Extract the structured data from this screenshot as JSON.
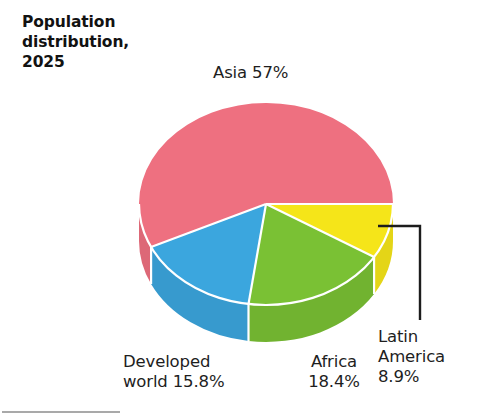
{
  "figure": {
    "title": "Population\ndistribution,\n2025",
    "background_color": "#ffffff"
  },
  "chart_data": {
    "type": "pie",
    "title": "Population distribution, 2025",
    "xlabel": "",
    "ylabel": "",
    "legend_position": "none",
    "grid": false,
    "style": "3d-exploded-none",
    "unit": "%",
    "categories": [
      "Asia",
      "Developed world",
      "Africa",
      "Latin America"
    ],
    "values": [
      57,
      15.8,
      18.4,
      8.9
    ],
    "colors": [
      "#ee7080",
      "#3ba6de",
      "#7ac134",
      "#f5e519"
    ],
    "slice_separator_color": "#ffffff",
    "slices": [
      {
        "name": "Asia",
        "value": 57,
        "value_label": "57%",
        "label": "Asia 57%",
        "color": "#ee7080",
        "start_angle_deg": 0,
        "sweep_deg": 205.2,
        "label_position": "top"
      },
      {
        "name": "Developed world",
        "value": 15.8,
        "value_label": "15.8%",
        "label": "Developed\nworld 15.8%",
        "color": "#3ba6de",
        "start_angle_deg": 205.2,
        "sweep_deg": 56.88,
        "label_position": "bottom-left"
      },
      {
        "name": "Africa",
        "value": 18.4,
        "value_label": "18.4%",
        "label": "Africa\n18.4%",
        "color": "#7ac134",
        "start_angle_deg": 262.08,
        "sweep_deg": 66.24,
        "label_position": "bottom-center"
      },
      {
        "name": "Latin America",
        "value": 8.9,
        "value_label": "8.9%",
        "label": "Latin\nAmerica\n8.9%",
        "color": "#f5e519",
        "start_angle_deg": 328.32,
        "sweep_deg": 32.04,
        "label_position": "right",
        "has_leader_line": true
      }
    ],
    "total": 100.1,
    "geometry": {
      "center_x": 266,
      "center_y": 204,
      "radius_x": 127,
      "radius_y": 101,
      "depth": 37
    }
  }
}
